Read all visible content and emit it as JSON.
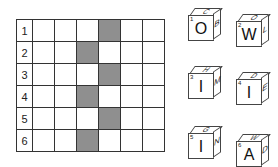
{
  "grid": {
    "rows": [
      {
        "label": "1",
        "shaded": [
          4
        ]
      },
      {
        "label": "2",
        "shaded": [
          3
        ]
      },
      {
        "label": "3",
        "shaded": [
          4
        ]
      },
      {
        "label": "4",
        "shaded": [
          3
        ]
      },
      {
        "label": "5",
        "shaded": [
          4
        ]
      },
      {
        "label": "6",
        "shaded": [
          3
        ]
      }
    ],
    "columns": 6,
    "shade_color": "#8f8f8f"
  },
  "dice": [
    {
      "number": "1",
      "front": "O",
      "top": "C",
      "side": "B"
    },
    {
      "number": "2",
      "front": "W",
      "top": "O",
      "side": "L"
    },
    {
      "number": "3",
      "front": "I",
      "top": "H",
      "side": "M"
    },
    {
      "number": "4",
      "front": "I",
      "top": "D",
      "side": "E"
    },
    {
      "number": "5",
      "front": "I",
      "top": "G",
      "side": "N"
    },
    {
      "number": "6",
      "front": "A",
      "top": "W",
      "side": "D"
    }
  ]
}
